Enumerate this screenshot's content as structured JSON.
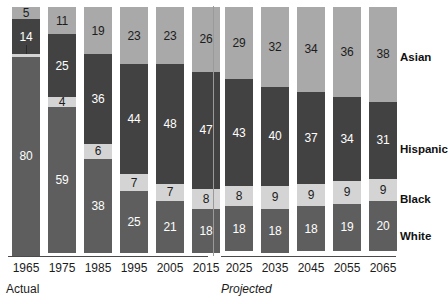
{
  "chart_data": {
    "type": "bar",
    "title": "",
    "subtitle": "",
    "xlabel": "",
    "ylabel": "",
    "stacked": true,
    "percent": true,
    "ylim": [
      0,
      100
    ],
    "grid": false,
    "legend_position": "right",
    "categories": [
      "1965",
      "1975",
      "1985",
      "1995",
      "2005",
      "2015",
      "2025",
      "2035",
      "2045",
      "2055",
      "2065"
    ],
    "series": [
      {
        "name": "Asian",
        "color": "#a9a9a9",
        "values": [
          5,
          11,
          19,
          23,
          23,
          26,
          29,
          32,
          34,
          36,
          38
        ]
      },
      {
        "name": "Hispanic",
        "color": "#424242",
        "values": [
          14,
          25,
          36,
          44,
          48,
          47,
          43,
          40,
          37,
          34,
          31
        ]
      },
      {
        "name": "Black",
        "color": "#d4d4d4",
        "values": [
          1,
          4,
          6,
          7,
          7,
          8,
          8,
          9,
          9,
          9,
          9
        ]
      },
      {
        "name": "White",
        "color": "#5e5e5e",
        "values": [
          80,
          59,
          38,
          25,
          21,
          18,
          18,
          18,
          18,
          19,
          20
        ]
      }
    ],
    "hidden_labels": [
      {
        "category": "1965",
        "series": "Black",
        "reason": "segment-too-small-leader-tick"
      }
    ],
    "annotations": {
      "actual_label": "Actual",
      "projected_label": "Projected",
      "divider_after_category": "2015"
    }
  },
  "legend": {
    "items": [
      {
        "label": "Asian",
        "color": "#a9a9a9"
      },
      {
        "label": "Hispanic",
        "color": "#424242"
      },
      {
        "label": "Black",
        "color": "#d4d4d4"
      },
      {
        "label": "White",
        "color": "#5e5e5e"
      }
    ]
  },
  "axis": {
    "ticks": [
      "1965",
      "1975",
      "1985",
      "1995",
      "2005",
      "2015",
      "2025",
      "2035",
      "2045",
      "2055",
      "2065"
    ]
  },
  "sections": {
    "actual": "Actual",
    "projected": "Projected"
  },
  "colors": {
    "asian": "#a9a9a9",
    "hispanic": "#424242",
    "black": "#d4d4d4",
    "white": "#5e5e5e",
    "background": "#ffffff",
    "axis": "#4a4a4a",
    "text": "#1c1c1c"
  }
}
